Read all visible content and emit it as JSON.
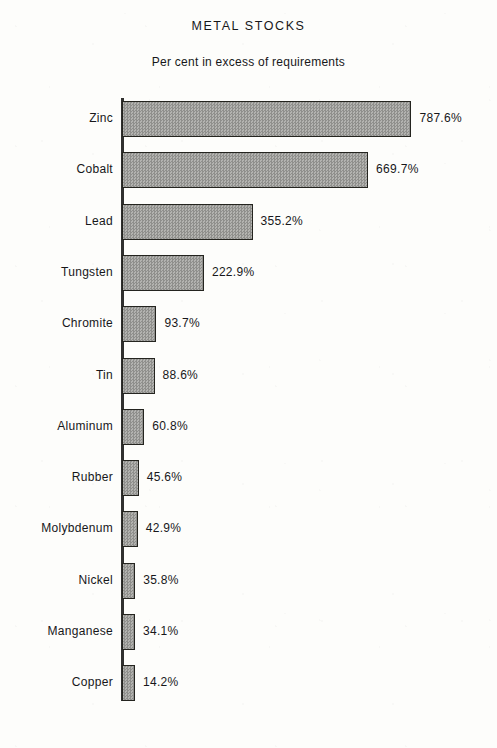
{
  "chart_data": {
    "type": "bar",
    "orientation": "horizontal",
    "title": "METAL STOCKS",
    "subtitle": "Per cent in excess of requirements",
    "xlabel": "",
    "ylabel": "",
    "grid": false,
    "legend": null,
    "value_suffix": "%",
    "xlim": [
      0,
      787.6
    ],
    "categories": [
      "Zinc",
      "Cobalt",
      "Lead",
      "Tungsten",
      "Chromite",
      "Tin",
      "Aluminum",
      "Rubber",
      "Molybdenum",
      "Nickel",
      "Manganese",
      "Copper"
    ],
    "values": [
      787.6,
      669.7,
      355.2,
      222.9,
      93.7,
      88.6,
      60.8,
      45.6,
      42.9,
      35.8,
      34.1,
      14.2
    ],
    "value_labels": [
      "787.6%",
      "669.7%",
      "355.2%",
      "222.9%",
      "93.7%",
      "88.6%",
      "60.8%",
      "45.6%",
      "42.9%",
      "35.8%",
      "34.1%",
      "14.2%"
    ],
    "colors": {
      "bar_fill": "#a0a09d",
      "bar_border": "#24241f",
      "axis": "#30302f",
      "text": "#17171a",
      "background": "#fdfdfb"
    }
  }
}
